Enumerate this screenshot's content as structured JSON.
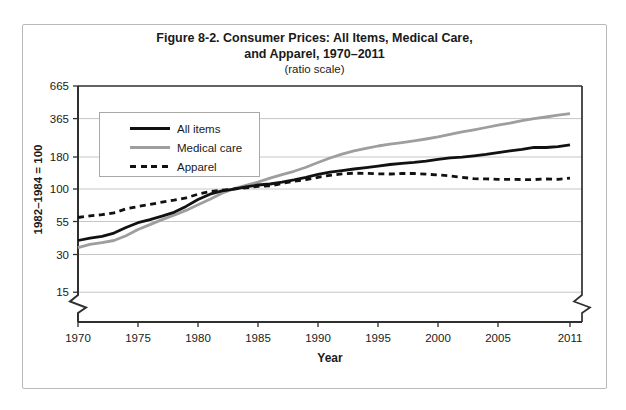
{
  "figure": {
    "title_line1": "Figure 8-2. Consumer Prices: All Items, Medical Care,",
    "title_line2": "and Apparel, 1970–2011",
    "subtitle": "(ratio scale)",
    "y_axis_label": "1982–1984 = 100",
    "x_axis_label": "Year"
  },
  "legend": {
    "position": "upper-left",
    "items": [
      {
        "label": "All items",
        "style": "solid",
        "color": "#111111"
      },
      {
        "label": "Medical care",
        "style": "solid",
        "color": "#9e9e9e"
      },
      {
        "label": "Apparel",
        "style": "dashed",
        "color": "#111111"
      }
    ]
  },
  "colors": {
    "line_black": "#111111",
    "line_gray": "#9e9e9e",
    "gridline": "#c6c6c6",
    "axis": "#2f2f2f",
    "figure_border": "#b9b9b9",
    "background": "#ffffff"
  },
  "chart_data": {
    "type": "line",
    "subtitle": "(ratio scale)",
    "xlabel": "Year",
    "ylabel": "1982–1984 = 100",
    "y_scale": "log",
    "grid": "horizontal",
    "legend_position": "upper-left",
    "axis_break_at_bottom": true,
    "ylim": [
      15,
      665
    ],
    "y_ticks": [
      665,
      365,
      180,
      100,
      55,
      30,
      15
    ],
    "x_ticks": [
      1970,
      1975,
      1980,
      1985,
      1990,
      1995,
      2000,
      2005,
      2011
    ],
    "draw_order": [
      1,
      0,
      2
    ],
    "x": [
      1970,
      1971,
      1972,
      1973,
      1974,
      1975,
      1976,
      1977,
      1978,
      1979,
      1980,
      1981,
      1982,
      1983,
      1984,
      1985,
      1986,
      1987,
      1988,
      1989,
      1990,
      1991,
      1992,
      1993,
      1994,
      1995,
      1996,
      1997,
      1998,
      1999,
      2000,
      2001,
      2002,
      2003,
      2004,
      2005,
      2006,
      2007,
      2008,
      2009,
      2010,
      2011
    ],
    "series": [
      {
        "name": "All items",
        "color": "#111111",
        "style": "solid",
        "values": [
          38.8,
          40.5,
          41.8,
          44.4,
          49.3,
          53.8,
          56.9,
          60.6,
          65.2,
          72.6,
          82.4,
          90.9,
          96.5,
          99.6,
          103.9,
          107.6,
          109.6,
          113.6,
          118.3,
          124.0,
          130.7,
          136.2,
          140.3,
          144.5,
          148.2,
          152.4,
          156.9,
          160.5,
          163.0,
          166.6,
          172.2,
          177.1,
          179.9,
          184.0,
          188.9,
          195.3,
          201.6,
          207.3,
          215.3,
          214.5,
          218.1,
          224.9
        ]
      },
      {
        "name": "Medical care",
        "color": "#9e9e9e",
        "style": "solid",
        "values": [
          34.0,
          36.1,
          37.3,
          38.8,
          42.4,
          47.5,
          52.0,
          57.0,
          61.8,
          67.5,
          74.9,
          82.9,
          92.5,
          100.6,
          106.8,
          113.5,
          122.0,
          130.1,
          138.6,
          149.3,
          162.8,
          177.0,
          190.1,
          201.4,
          211.0,
          220.5,
          228.2,
          234.6,
          242.1,
          250.6,
          260.8,
          272.8,
          285.6,
          297.1,
          310.1,
          323.2,
          336.2,
          351.1,
          364.1,
          375.6,
          388.4,
          400.3
        ]
      },
      {
        "name": "Apparel",
        "color": "#111111",
        "style": "dashed",
        "values": [
          59.2,
          61.1,
          62.3,
          64.6,
          69.4,
          72.5,
          75.2,
          78.6,
          81.4,
          84.9,
          90.9,
          95.3,
          97.8,
          100.2,
          102.1,
          105.0,
          105.9,
          110.6,
          115.4,
          118.6,
          124.1,
          128.7,
          131.9,
          133.7,
          133.4,
          132.0,
          131.7,
          132.9,
          133.0,
          131.3,
          129.6,
          127.3,
          124.0,
          120.9,
          120.4,
          119.5,
          119.5,
          119.0,
          118.9,
          120.1,
          119.5,
          122.1
        ]
      }
    ]
  }
}
